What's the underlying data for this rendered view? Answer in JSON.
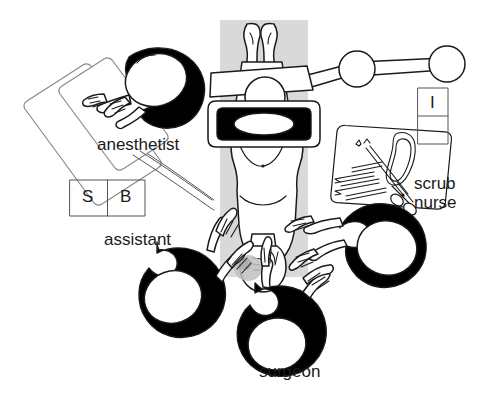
{
  "figure": {
    "type": "operating-theatre-layout-diagram",
    "style": "black-and-white line drawing, overhead (plan) view",
    "background_color": "#ffffff",
    "line_color": "#1a1a1a",
    "gown_fill": "#000000",
    "drape_band_color": "#d9d9d9",
    "width": 493,
    "height": 399
  },
  "labels": {
    "anesthetist": "anesthetist",
    "assistant": "assistant",
    "surgeon": "surgeon",
    "scrub_nurse_line1": "scrub",
    "scrub_nurse_line2": "nurse"
  },
  "equipment_boxes": {
    "sb_box": {
      "cells": [
        "S",
        "B"
      ],
      "orientation": "horizontal",
      "x": 70,
      "y": 180,
      "width": 75,
      "height": 36
    },
    "i_box": {
      "cells": [
        "I",
        ""
      ],
      "orientation": "vertical",
      "x": 418,
      "y": 88,
      "width": 30,
      "height": 56
    }
  },
  "staff": [
    {
      "role": "anesthetist",
      "position": "upper-left",
      "facing": "patient head end"
    },
    {
      "role": "assistant",
      "position": "lower-left",
      "facing": "operative site"
    },
    {
      "role": "surgeon",
      "position": "bottom-center",
      "facing": "operative site"
    },
    {
      "role": "scrub nurse",
      "position": "right",
      "facing": "instrument tray"
    }
  ],
  "elements": {
    "patient": "supine patient on table, head toward bottom, legs flexed at top",
    "operating_lamp": "overhead light head with black surround and white elliptical lens",
    "lamp_arm": "articulated suspension arm with two ball joints extending to the right",
    "instrument_tray": "tilted rectangular Mayo tray with scalpels, forceps, scissors and kidney dish",
    "anesthesia_machine": "two tilted rectangular panels at upper left",
    "drape_band": "vertical grey sterile drape band running down the centre"
  }
}
